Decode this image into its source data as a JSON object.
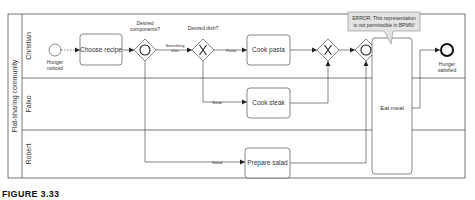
{
  "pool": {
    "label": "Flat-sharing community"
  },
  "lanes": [
    {
      "label": "Christian"
    },
    {
      "label": "Falko"
    },
    {
      "label": "Robert"
    }
  ],
  "events": {
    "start": {
      "label_line1": "Hunger",
      "label_line2": "noticed"
    },
    "end": {
      "label_line1": "Hunger",
      "label_line2": "satisfied"
    }
  },
  "gateways": {
    "inclusive_split": {
      "label_line1": "Desired",
      "label_line2": "components?"
    },
    "xor_split": {
      "label": "Desired dish?"
    }
  },
  "tasks": {
    "choose_recipe": "Choose recipe",
    "cook_pasta": "Cook pasta",
    "cook_steak": "Cook steak",
    "prepare_salad": "Prepare salad",
    "eat_meal": "Eat meal"
  },
  "flows": {
    "something_else_line1": "Something",
    "something_else_line2": "else",
    "pasta": "Pasta",
    "steak": "Steak",
    "salad": "Salad"
  },
  "annotation": {
    "line1": "ERROR: This representation",
    "line2": "is not permissible in BPMN!"
  },
  "caption": "FIGURE 3.33"
}
